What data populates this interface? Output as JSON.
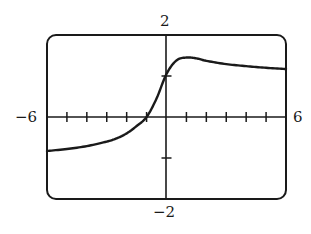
{
  "chart_data": {
    "type": "line",
    "title": "",
    "xlabel": "",
    "ylabel": "",
    "xlim": [
      -6,
      6
    ],
    "ylim": [
      -2,
      2
    ],
    "grid": false,
    "legend": null,
    "x_ticks": [
      -5,
      -4,
      -3,
      -2,
      -1,
      1,
      2,
      3,
      4,
      5
    ],
    "y_ticks": [
      -1,
      1
    ],
    "axis_labels": {
      "x_min": "−6",
      "x_max": "6",
      "y_max": "2",
      "y_min": "−2"
    },
    "series": [
      {
        "name": "f(x)",
        "x": [
          -6,
          -5,
          -4,
          -3,
          -2.5,
          -2,
          -1.5,
          -1,
          -0.5,
          0,
          0.5,
          1,
          1.5,
          2,
          3,
          4,
          5,
          6
        ],
        "y": [
          -0.83,
          -0.78,
          -0.71,
          -0.6,
          -0.52,
          -0.4,
          -0.22,
          0.0,
          0.45,
          1.05,
          1.38,
          1.45,
          1.43,
          1.37,
          1.29,
          1.24,
          1.2,
          1.17
        ]
      }
    ]
  },
  "colors": {
    "stroke": "#1a1a1a",
    "background": "#ffffff"
  }
}
